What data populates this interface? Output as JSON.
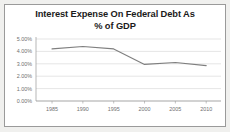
{
  "chart_data": {
    "type": "line",
    "title": "Interest Expense On Federal Debt As % of GDP",
    "title_line1": "Interest Expense On Federal Debt As",
    "title_line2": "% of GDP",
    "xlabel": "",
    "ylabel": "",
    "categories": [
      "1985",
      "1990",
      "1995",
      "2000",
      "2005",
      "2010"
    ],
    "x": [
      1985,
      1990,
      1995,
      2000,
      2005,
      2010
    ],
    "values": [
      4.2,
      4.4,
      4.2,
      2.95,
      3.1,
      2.85
    ],
    "series": [
      {
        "name": "Interest Expense as % of GDP",
        "values": [
          4.2,
          4.4,
          4.2,
          2.95,
          3.1,
          2.85
        ]
      }
    ],
    "ylim": [
      0,
      5
    ],
    "ytick_values": [
      0,
      1,
      2,
      3,
      4,
      5
    ],
    "ytick_labels": [
      "0.00%",
      "1.00%",
      "2.00%",
      "3.00%",
      "4.00%",
      "5.00%"
    ],
    "xtick_labels": [
      "1985",
      "1990",
      "1995",
      "2000",
      "2005",
      "2010"
    ],
    "grid": true,
    "grid_axis": "y",
    "legend": false,
    "legend_position": "none",
    "line_color": "#7f7f7f",
    "grid_color": "#d4d4d4",
    "axis_color": "#9a9a9a",
    "tick_label_color": "#6f6f6f",
    "title_color": "#1b1b1b",
    "plot_background": "#ffffff",
    "frame_background": "#f0f0ee",
    "border_color": "#9a9a9a"
  }
}
